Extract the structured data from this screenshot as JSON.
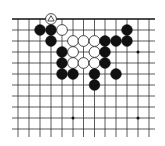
{
  "diagram": {
    "type": "go-board-fragment",
    "edges": {
      "top": true,
      "left": false,
      "right": false,
      "bottom": false
    },
    "grid": {
      "columns": [
        18,
        29,
        40,
        51,
        62,
        73,
        83.5,
        94.5,
        105,
        116,
        127,
        138,
        149
      ],
      "rows": [
        19,
        30,
        41,
        52,
        63,
        74,
        85,
        96,
        107,
        118,
        129
      ],
      "line_color": "#333333",
      "edge_line_color": "#111111",
      "x_extent": [
        12,
        155
      ],
      "y_extent": [
        19,
        137
      ]
    },
    "stone_radius": 5.4,
    "colors": {
      "black": "#111111",
      "white_fill": "#ffffff",
      "white_stroke": "#222222",
      "marker": "#222222"
    },
    "star_points": [
      {
        "col": 11,
        "row": 3
      },
      {
        "col": 5,
        "row": 9
      },
      {
        "col": 11,
        "row": 9
      }
    ],
    "stones": [
      {
        "color": "white",
        "col": 3,
        "row": 0,
        "marker": "triangle"
      },
      {
        "color": "black",
        "col": 2,
        "row": 1
      },
      {
        "color": "black",
        "col": 3,
        "row": 1
      },
      {
        "color": "white",
        "col": 4,
        "row": 1
      },
      {
        "color": "black",
        "col": 10,
        "row": 1
      },
      {
        "color": "black",
        "col": 3,
        "row": 2
      },
      {
        "color": "white",
        "col": 5,
        "row": 2
      },
      {
        "color": "white",
        "col": 6,
        "row": 2
      },
      {
        "color": "white",
        "col": 7,
        "row": 2
      },
      {
        "color": "black",
        "col": 8,
        "row": 2
      },
      {
        "color": "black",
        "col": 9,
        "row": 2
      },
      {
        "color": "black",
        "col": 10,
        "row": 2
      },
      {
        "color": "black",
        "col": 4,
        "row": 3
      },
      {
        "color": "white",
        "col": 5,
        "row": 3
      },
      {
        "color": "white",
        "col": 7,
        "row": 3
      },
      {
        "color": "black",
        "col": 8,
        "row": 3
      },
      {
        "color": "black",
        "col": 4,
        "row": 4
      },
      {
        "color": "white",
        "col": 5,
        "row": 4
      },
      {
        "color": "white",
        "col": 6,
        "row": 4
      },
      {
        "color": "white",
        "col": 7,
        "row": 4
      },
      {
        "color": "black",
        "col": 8,
        "row": 4
      },
      {
        "color": "black",
        "col": 4,
        "row": 5
      },
      {
        "color": "black",
        "col": 5,
        "row": 5
      },
      {
        "color": "black",
        "col": 7,
        "row": 5
      },
      {
        "color": "black",
        "col": 9,
        "row": 5
      },
      {
        "color": "black",
        "col": 7,
        "row": 6
      }
    ]
  }
}
